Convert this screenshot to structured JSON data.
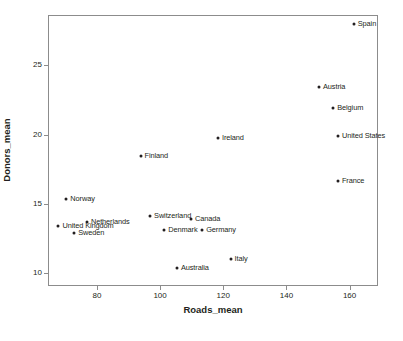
{
  "chart_data": {
    "type": "scatter",
    "title": "",
    "xlabel": "Roads_mean",
    "ylabel": "Donors_mean",
    "xlim": [
      64.5,
      169
    ],
    "ylim": [
      9.1,
      28.6
    ],
    "xticks": [
      80,
      100,
      120,
      140,
      160
    ],
    "xticklabels": [
      "80",
      "100",
      "120",
      "140",
      "160"
    ],
    "yticks": [
      10,
      15,
      20,
      25
    ],
    "yticklabels": [
      "10",
      "15",
      "20",
      "25"
    ],
    "grid": false,
    "legend": null,
    "marker_color": "#231f20",
    "frame_color": "#8c8c8c",
    "points": [
      {
        "label": "Spain",
        "x": 161.0,
        "y": 28.0,
        "label_side": "right"
      },
      {
        "label": "Austria",
        "x": 150.0,
        "y": 23.5,
        "label_side": "right"
      },
      {
        "label": "Belgium",
        "x": 154.5,
        "y": 22.0,
        "label_side": "right"
      },
      {
        "label": "United States",
        "x": 156.0,
        "y": 20.0,
        "label_side": "right"
      },
      {
        "label": "Ireland",
        "x": 118.0,
        "y": 19.8,
        "label_side": "right"
      },
      {
        "label": "Finland",
        "x": 93.5,
        "y": 18.5,
        "label_side": "right"
      },
      {
        "label": "France",
        "x": 156.0,
        "y": 16.7,
        "label_side": "right"
      },
      {
        "label": "Norway",
        "x": 70.0,
        "y": 15.4,
        "label_side": "right"
      },
      {
        "label": "Switzerland",
        "x": 96.5,
        "y": 14.2,
        "label_side": "right"
      },
      {
        "label": "Canada",
        "x": 109.5,
        "y": 14.0,
        "label_side": "right"
      },
      {
        "label": "Netherlands",
        "x": 76.5,
        "y": 13.8,
        "label_side": "right"
      },
      {
        "label": "United Kingdom",
        "x": 67.5,
        "y": 13.5,
        "label_side": "right"
      },
      {
        "label": "Denmark",
        "x": 101.0,
        "y": 13.2,
        "label_side": "right"
      },
      {
        "label": "Germany",
        "x": 113.0,
        "y": 13.2,
        "label_side": "right"
      },
      {
        "label": "Sweden",
        "x": 72.5,
        "y": 13.0,
        "label_side": "right"
      },
      {
        "label": "Italy",
        "x": 122.0,
        "y": 11.1,
        "label_side": "right"
      },
      {
        "label": "Australia",
        "x": 105.0,
        "y": 10.5,
        "label_side": "right"
      }
    ]
  }
}
